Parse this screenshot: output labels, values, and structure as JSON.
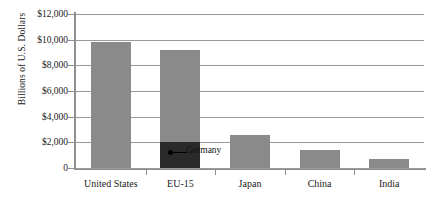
{
  "chart_data": {
    "type": "bar",
    "title": "",
    "xlabel": "",
    "ylabel": "Billions of U.S. Dollars",
    "categories": [
      "United States",
      "EU-15",
      "Japan",
      "China",
      "India"
    ],
    "values": [
      9800,
      9200,
      2600,
      1400,
      700
    ],
    "ylim": [
      0,
      12000
    ],
    "ytick_labels": [
      "$12,000",
      "$10,000",
      "$8,000",
      "$6,000",
      "$4,000",
      "$2,000",
      "0"
    ],
    "ytick_values": [
      12000,
      10000,
      8000,
      6000,
      4000,
      2000,
      0
    ],
    "grid": true,
    "legend": "none",
    "series": [
      {
        "name": "GDP",
        "values": [
          9800,
          9200,
          2600,
          1400,
          700
        ],
        "color": "#8a8a8a"
      }
    ],
    "annotations": [
      {
        "label": "Germany",
        "category": "EU-15",
        "value": 2000,
        "color": "#2a2a2a",
        "note": "dark sub-segment at base of EU-15 bar"
      }
    ]
  },
  "axis": {
    "y_title": "Billions of U.S. Dollars"
  },
  "colors": {
    "bar": "#8a8a8a",
    "bar_highlight": "#2a2a2a",
    "gridline": "#9a9a9a",
    "axis": "#8f8f8f",
    "background": "#ffffff"
  }
}
